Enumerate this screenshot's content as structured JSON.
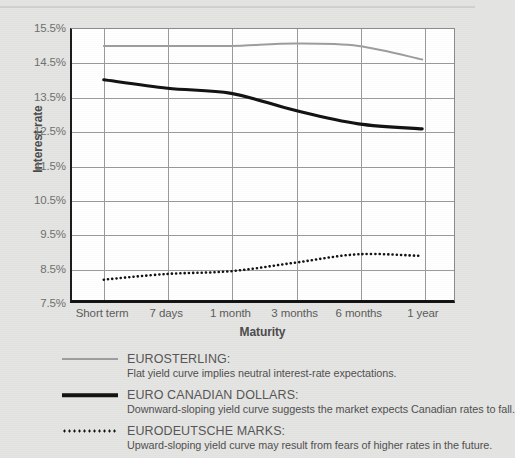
{
  "chart_data": {
    "type": "line",
    "title": "",
    "xlabel": "Maturity",
    "ylabel": "Interest rate",
    "categories": [
      "Short term",
      "7 days",
      "1 month",
      "3 months",
      "6 months",
      "1 year"
    ],
    "ylim": [
      7.5,
      15.5
    ],
    "ytick_labels": [
      "15.5%",
      "14.5%",
      "13.5%",
      "12.5%",
      "11.5%",
      "10.5%",
      "9.5%",
      "8.5%",
      "7.5%"
    ],
    "ytick_values": [
      15.5,
      14.5,
      13.5,
      12.5,
      11.5,
      10.5,
      9.5,
      8.5,
      7.5
    ],
    "grid": true,
    "legend_position": "below",
    "series": [
      {
        "name": "EUROSTERLING",
        "style": "solid-thin",
        "color": "#9d9d9d",
        "values": [
          15.0,
          15.0,
          15.0,
          15.07,
          15.0,
          14.6
        ]
      },
      {
        "name": "EURO CANADIAN DOLLARS",
        "style": "solid-thick",
        "color": "#111111",
        "values": [
          14.0,
          13.75,
          13.6,
          13.1,
          12.7,
          12.55
        ]
      },
      {
        "name": "EURODEUTSCHE MARKS",
        "style": "dotted",
        "color": "#111111",
        "values": [
          8.1,
          8.27,
          8.35,
          8.6,
          8.85,
          8.8
        ]
      }
    ]
  },
  "legend": {
    "entries": [
      {
        "title": "EUROSTERLING:",
        "description": "Flat yield curve implies neutral interest-rate expectations.",
        "swatch": "grey-solid-line-swatch"
      },
      {
        "title": "EURO CANADIAN DOLLARS:",
        "description": "Downward-sloping yield curve suggests the market expects Canadian rates to fall.",
        "swatch": "black-solid-line-swatch"
      },
      {
        "title": "EURODEUTSCHE MARKS:",
        "description": "Upward-sloping yield curve may result from fears of higher rates in the future.",
        "swatch": "black-dotted-line-swatch"
      }
    ]
  }
}
